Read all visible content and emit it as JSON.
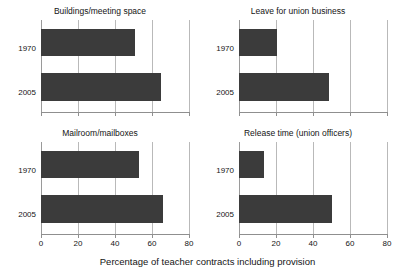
{
  "chart_data": {
    "type": "bar",
    "title": "",
    "xlabel": "Percentage of teacher contracts including provision",
    "ylabel": "",
    "orientation": "horizontal",
    "categories": [
      "1970",
      "2005"
    ],
    "xlim": [
      0,
      80
    ],
    "xticks": [
      0,
      20,
      40,
      60,
      80
    ],
    "xtick_labels": [
      "0",
      "20",
      "40",
      "60",
      "80"
    ],
    "grid": true,
    "legend": "none",
    "bar_color": "#3b3b3b",
    "panels": [
      {
        "title": "Buildings/meeting space",
        "position": "top-left",
        "values": [
          51,
          65
        ]
      },
      {
        "title": "Leave for union business",
        "position": "top-right",
        "values": [
          20.5,
          48.5
        ]
      },
      {
        "title": "Mailroom/mailboxes",
        "position": "bottom-left",
        "values": [
          53,
          66
        ]
      },
      {
        "title": "Release time (union officers)",
        "position": "bottom-right",
        "values": [
          13.5,
          50
        ]
      }
    ]
  }
}
